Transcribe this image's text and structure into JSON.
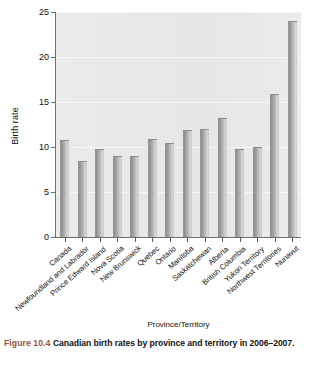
{
  "chart_data": {
    "type": "bar",
    "title": "",
    "xlabel": "Province/Territory",
    "ylabel": "Birth rate",
    "ylim": [
      0,
      25
    ],
    "yticks": [
      0,
      5,
      10,
      15,
      20,
      25
    ],
    "grid": true,
    "legend": null,
    "categories": [
      "Canada",
      "Newfoundland and Labrador",
      "Prince Edward Island",
      "Nova Scotia",
      "New Brunswick",
      "Quebec",
      "Ontario",
      "Manitoba",
      "Saskatchewan",
      "Alberta",
      "British Columbia",
      "Yukon Territory",
      "Northwest Territories",
      "Nunavut"
    ],
    "values": [
      10.8,
      8.5,
      9.8,
      9.0,
      9.0,
      10.9,
      10.5,
      11.9,
      12.0,
      13.2,
      9.8,
      10.0,
      15.9,
      24.0
    ],
    "bar_color": "#a8a8a8",
    "plot_background": "#e9e9e9"
  },
  "caption": {
    "figure_number": "Figure 10.4",
    "text": "Canadian birth rates by province and territory in 2006–2007.",
    "number_color": "#9c5140"
  }
}
